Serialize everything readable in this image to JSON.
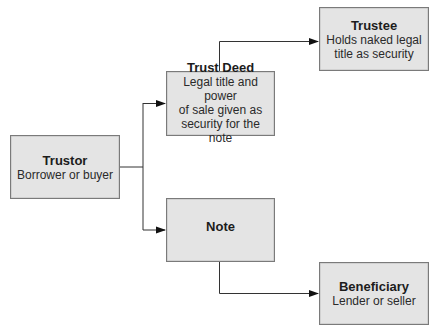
{
  "diagram": {
    "type": "flow",
    "nodes": [
      {
        "id": "trustor",
        "title": "Trustor",
        "description": "Borrower or buyer"
      },
      {
        "id": "trust_deed",
        "title": "Trust Deed",
        "description": "Legal title and power of sale given as security for the note"
      },
      {
        "id": "trustee",
        "title": "Trustee",
        "description": "Holds naked legal title as security"
      },
      {
        "id": "note",
        "title": "Note",
        "description": ""
      },
      {
        "id": "beneficiary",
        "title": "Beneficiary",
        "description": "Lender or seller"
      }
    ],
    "edges": [
      {
        "from": "trustor",
        "to": "trust_deed"
      },
      {
        "from": "trustor",
        "to": "note"
      },
      {
        "from": "trust_deed",
        "to": "trustee"
      },
      {
        "from": "note",
        "to": "beneficiary"
      }
    ]
  },
  "boxes": {
    "trustor": {
      "title": "Trustor",
      "desc": "Borrower or buyer"
    },
    "trust_deed": {
      "title": "Trust Deed",
      "desc_lines": [
        "Legal title and power",
        "of sale given as",
        "security for the note"
      ]
    },
    "trustee": {
      "title": "Trustee",
      "desc_lines": [
        "Holds naked legal",
        "title as security"
      ]
    },
    "note": {
      "title": "Note"
    },
    "beneficiary": {
      "title": "Beneficiary",
      "desc": "Lender or seller"
    }
  },
  "colors": {
    "box_fill": "#e4e4e4",
    "box_border": "#7a7a7a",
    "line": "#333333",
    "arrow": "#111111"
  }
}
